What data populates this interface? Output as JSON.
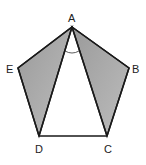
{
  "diagram": {
    "vertices": {
      "A": {
        "label": "A",
        "x": 72,
        "y": 27
      },
      "B": {
        "label": "B",
        "x": 129,
        "y": 68
      },
      "C": {
        "label": "C",
        "x": 107,
        "y": 136
      },
      "D": {
        "label": "D",
        "x": 39,
        "y": 136
      },
      "E": {
        "label": "E",
        "x": 18,
        "y": 68
      }
    },
    "shaded_regions": [
      "ABC",
      "ADE"
    ],
    "angle_marked": "DAC",
    "colors": {
      "shade": "#a8a8a8",
      "stroke": "#1a1a1a"
    }
  }
}
